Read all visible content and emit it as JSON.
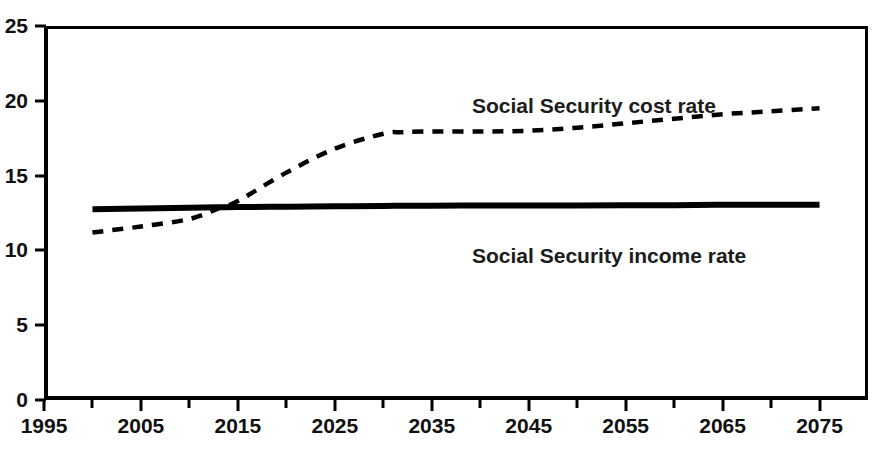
{
  "title_remnant": "",
  "chart_data": {
    "type": "line",
    "title": "",
    "subtitle": "",
    "xlabel": "",
    "ylabel": "",
    "xlim": [
      1995,
      2080
    ],
    "ylim": [
      0,
      25
    ],
    "grid": false,
    "legend_position": "inline-annotation",
    "x_ticks_major": [
      1995,
      2005,
      2015,
      2025,
      2035,
      2045,
      2055,
      2065,
      2075
    ],
    "x_ticks_minor": [
      2000,
      2010,
      2020,
      2030,
      2040,
      2050,
      2060,
      2070
    ],
    "y_ticks": [
      0,
      5,
      10,
      15,
      20,
      25
    ],
    "x_tick_labels": [
      "1995",
      "2005",
      "2015",
      "2025",
      "2035",
      "2045",
      "2055",
      "2065",
      "2075"
    ],
    "y_tick_labels": [
      "0",
      "5",
      "10",
      "15",
      "20",
      "25"
    ],
    "x": [
      2000,
      2005,
      2010,
      2013,
      2015,
      2020,
      2025,
      2030,
      2032,
      2035,
      2040,
      2045,
      2050,
      2055,
      2060,
      2065,
      2070,
      2075
    ],
    "series": [
      {
        "name": "Social Security cost rate",
        "style": "dashed",
        "color": "#000000",
        "values": [
          11.2,
          11.6,
          12.1,
          12.8,
          13.3,
          15.2,
          16.8,
          17.8,
          17.9,
          17.95,
          17.95,
          18.0,
          18.2,
          18.5,
          18.8,
          19.1,
          19.3,
          19.5
        ]
      },
      {
        "name": "Social Security income rate",
        "style": "solid",
        "color": "#000000",
        "values": [
          12.75,
          12.8,
          12.85,
          12.88,
          12.9,
          12.92,
          12.95,
          12.97,
          12.98,
          12.98,
          13.0,
          13.0,
          13.0,
          13.02,
          13.02,
          13.05,
          13.05,
          13.05
        ]
      }
    ],
    "annotations": [
      {
        "text": "Social Security cost rate",
        "x": 2025,
        "y": 21.5
      },
      {
        "text": "Social Security income rate",
        "x": 2025,
        "y": 11.0
      }
    ]
  }
}
